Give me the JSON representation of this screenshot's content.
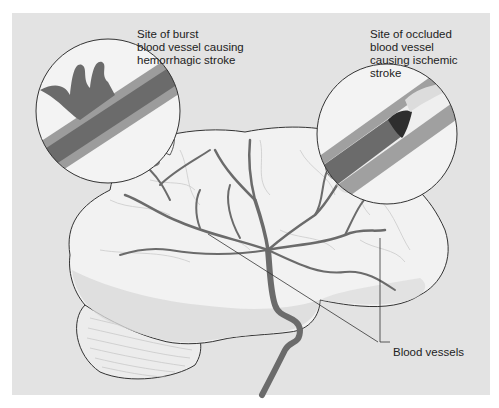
{
  "figure": {
    "type": "medical illustration",
    "colors": {
      "background_panel": "#e3e3e3",
      "brain_fill": "#f2f2f2",
      "brain_lobe_shade": "#d8d8d8",
      "vessel": "#6b6b6b",
      "vessel_wall": "#9a9a9a",
      "clot": "#2e2e2e",
      "outline": "#333333"
    }
  },
  "labels": {
    "hemorrhagic": "Site of burst\nblood vessel causing\nhemorrhagic stroke",
    "ischemic": "Site of occluded\nblood vessel\ncausing ischemic\nstroke",
    "vessels": "Blood vessels"
  },
  "insets": [
    {
      "name": "hemorrhagic-inset",
      "description": "Magnified burst blood vessel with leaking blood"
    },
    {
      "name": "ischemic-inset",
      "description": "Magnified blood vessel occluded by a clot"
    }
  ]
}
